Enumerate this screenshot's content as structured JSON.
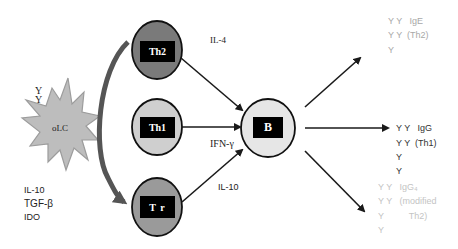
{
  "diagram": {
    "source_cell": {
      "label": "oLC",
      "antibody_glyphs": [
        "Y",
        "Y"
      ],
      "secretes": [
        "IL-10",
        "TGF-β",
        "IDO"
      ],
      "fill": "#b9b9b9"
    },
    "t_cells": [
      {
        "id": "th2",
        "label": "Th2",
        "fill": "#7a7a7a",
        "cytokine": "IL-4"
      },
      {
        "id": "th1",
        "label": "Th1",
        "fill": "#cfcfcf",
        "cytokine": "IFN-γ"
      },
      {
        "id": "tr",
        "label": "T r",
        "fill": "#9a9a9a",
        "cytokine": "IL-10"
      }
    ],
    "b_cell": {
      "label": "B",
      "fill": "#e6e6e6"
    },
    "outputs": [
      {
        "id": "ige-th2",
        "rows": [
          "Y Y   IgE",
          "Y Y  (Th2)",
          "Y"
        ],
        "color": "#a8a8a8"
      },
      {
        "id": "igg-th1",
        "rows": [
          "Y Y   IgG",
          "Y Y  (Th1)",
          "Y",
          "Y"
        ],
        "color": "#333333"
      },
      {
        "id": "igg4-modified-th2",
        "rows": [
          "Y Y   IgG₄",
          "Y Y   (modified",
          "Y          Th2)",
          "Y"
        ],
        "color": "#c4c4c4"
      }
    ],
    "colors": {
      "stroke": "#1a1a1a",
      "curved_arrow": "#555555",
      "box": "#000000"
    }
  }
}
